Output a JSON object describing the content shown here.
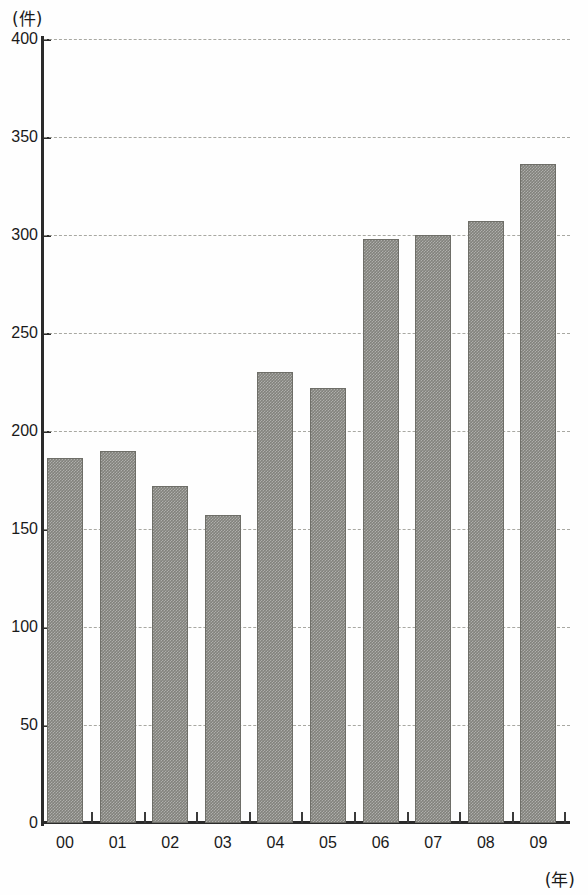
{
  "chart_data": {
    "type": "bar",
    "title": "",
    "subtitle": "",
    "xlabel": "(年)",
    "ylabel": "(件)",
    "categories": [
      "00",
      "01",
      "02",
      "03",
      "04",
      "05",
      "06",
      "07",
      "08",
      "09"
    ],
    "values": [
      186,
      190,
      172,
      157,
      230,
      222,
      298,
      300,
      307,
      336
    ],
    "series": [
      {
        "name": "件数",
        "values": [
          186,
          190,
          172,
          157,
          230,
          222,
          298,
          300,
          307,
          336
        ]
      }
    ],
    "ylim": [
      0,
      400
    ],
    "yticks": [
      0,
      50,
      100,
      150,
      200,
      250,
      300,
      350,
      400
    ],
    "ytick_labels": [
      "0",
      "50",
      "100",
      "150",
      "200",
      "250",
      "300",
      "350",
      "400"
    ],
    "grid": true,
    "grid_axis": "y",
    "grid_style": "dashed",
    "legend": false,
    "legend_position": "none",
    "bar_color": "#82827c",
    "bar_edge_color": "#6e6e68",
    "gridline_color": "#9a9a92",
    "axis_color": "#2b2b2b",
    "background_color": "#fefefe"
  },
  "axes": {
    "y_unit": "(件)",
    "x_unit": "(年)"
  }
}
